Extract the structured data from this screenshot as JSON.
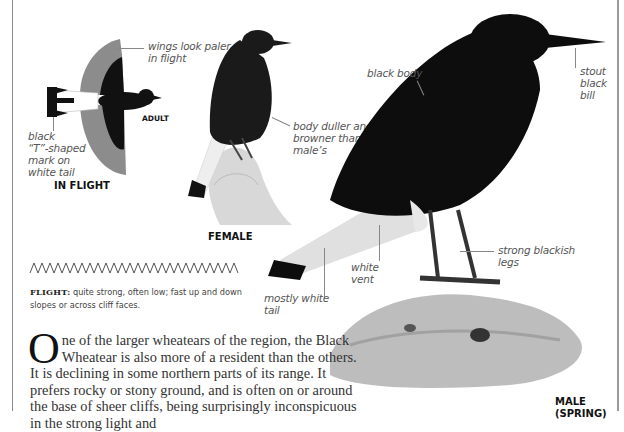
{
  "illustrations": {
    "flight": {
      "caption": "IN FLIGHT",
      "age_caption": "ADULT",
      "labels": {
        "wings": [
          "wings look paler",
          "in flight"
        ],
        "tail": [
          "black",
          "“T”-shaped",
          "mark on",
          "white tail"
        ]
      }
    },
    "female": {
      "caption": "FEMALE",
      "labels": {
        "body": [
          "body duller and",
          "browner than",
          "male’s"
        ]
      }
    },
    "male": {
      "caption": "MALE",
      "caption_sub": "(SPRING)",
      "labels": {
        "body": "black body",
        "bill": [
          "stout",
          "black",
          "bill"
        ],
        "legs": [
          "strong blackish",
          "legs"
        ],
        "vent": [
          "white",
          "vent"
        ],
        "tail": [
          "mostly white",
          "tail"
        ]
      }
    }
  },
  "flight_note": {
    "heading": "FLIGHT:",
    "text": " quite strong, often low; fast up and down slopes or across cliff faces."
  },
  "body_text": {
    "dropcap": "O",
    "text": "ne of the larger wheatears of the region, the Black Wheatear is also more of a resident than the others. It is declining in some northern parts of its range. It prefers rocky or stony ground, and is often on or around the base of sheer cliffs, being surprisingly inconspicuous in the strong light and"
  },
  "colors": {
    "text_label": "#555555",
    "bird_black": "#0d0d0d",
    "wing_grey": "#8c8c8c",
    "border": "#8a8a8a"
  }
}
